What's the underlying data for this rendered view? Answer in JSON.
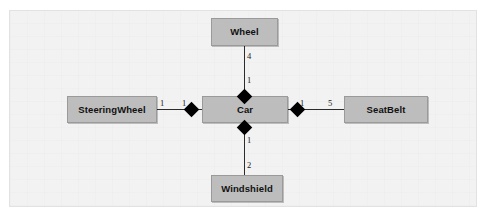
{
  "diagram": {
    "kind": "uml-class-diagram",
    "relationship_type": "composition",
    "background_color": "#f2f2f2",
    "box_fill_color": "#bdbdbd",
    "box_border_color": "#9a9a9a",
    "line_color": "#2b2b2b",
    "diamond_color": "#000000",
    "classes": {
      "wheel": {
        "label": "Wheel"
      },
      "steering_wheel": {
        "label": "SteeringWheel"
      },
      "car": {
        "label": "Car"
      },
      "seatbelt": {
        "label": "SeatBelt"
      },
      "windshield": {
        "label": "Windshield"
      }
    },
    "associations": [
      {
        "id": "car-wheel",
        "whole": "Car",
        "part": "Wheel",
        "whole_multiplicity": "1",
        "part_multiplicity": "4"
      },
      {
        "id": "car-steeringwheel",
        "whole": "Car",
        "part": "SteeringWheel",
        "whole_multiplicity": "1",
        "part_multiplicity": "1"
      },
      {
        "id": "car-seatbelt",
        "whole": "Car",
        "part": "SeatBelt",
        "whole_multiplicity": "1",
        "part_multiplicity": "5"
      },
      {
        "id": "car-windshield",
        "whole": "Car",
        "part": "Windshield",
        "whole_multiplicity": "1",
        "part_multiplicity": "2"
      }
    ],
    "multiplicity_labels": {
      "wheel_top": "4",
      "wheel_near_car": "1",
      "steeringwheel_near_box": "1",
      "steeringwheel_near_car": "1",
      "seatbelt_near_car": "1",
      "seatbelt_near_box": "5",
      "windshield_near_car": "1",
      "windshield_near_box": "2"
    }
  }
}
